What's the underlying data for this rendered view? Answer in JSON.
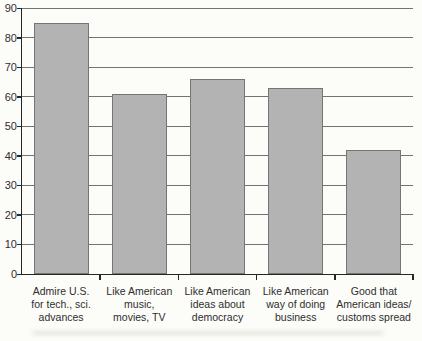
{
  "figure": {
    "background": "#fcfcf9"
  },
  "chart_data": {
    "type": "bar",
    "title": "",
    "xlabel": "",
    "ylabel": "",
    "categories": [
      "Admire U.S. for tech., sci. advances",
      "Like American music, movies, TV",
      "Like American ideas about democracy",
      "Like American way of doing business",
      "Good that American ideas/ customs spread"
    ],
    "category_lines": [
      [
        "Admire U.S.",
        "for tech., sci.",
        "advances"
      ],
      [
        "Like American",
        "music,",
        "movies, TV"
      ],
      [
        "Like American",
        "ideas about",
        "democracy"
      ],
      [
        "Like American",
        "way of doing",
        "business"
      ],
      [
        "Good that",
        "American ideas/",
        "customs spread"
      ]
    ],
    "values": [
      85,
      61,
      66,
      63,
      42
    ],
    "ylim": [
      0,
      90
    ],
    "yticks": [
      0,
      10,
      20,
      30,
      40,
      50,
      60,
      70,
      80,
      90
    ],
    "grid": true,
    "legend": "none",
    "colors": {
      "bar_fill": "#b3b3b3",
      "bar_border": "#757575",
      "gridline": "#5a5a5a",
      "axis": "#262626",
      "text": "#2e2e2e",
      "paper": "#fcfcf9"
    }
  }
}
